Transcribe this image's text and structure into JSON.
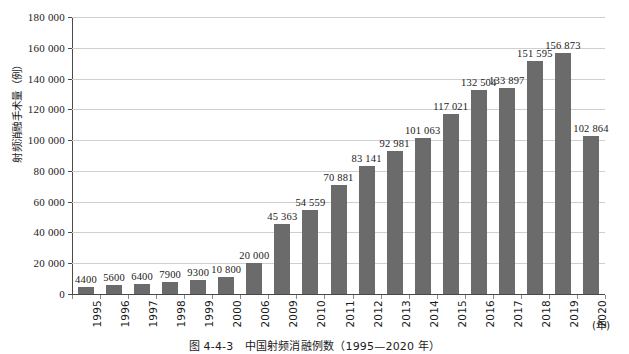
{
  "chart_data": {
    "type": "bar",
    "title": "",
    "xlabel": "(年)",
    "ylabel": "射频消融手术量（例）",
    "categories": [
      "1995",
      "1996",
      "1997",
      "1998",
      "1999",
      "2000",
      "2006",
      "2009",
      "2010",
      "2011",
      "2012",
      "2013",
      "2014",
      "2015",
      "2016",
      "2017",
      "2018",
      "2019",
      "2020"
    ],
    "values": [
      4400,
      5600,
      6400,
      7900,
      9300,
      10800,
      20000,
      45363,
      54559,
      70881,
      83141,
      92981,
      101063,
      117021,
      132504,
      133897,
      151595,
      156873,
      102864
    ],
    "value_labels": [
      "4400",
      "5600",
      "6400",
      "7900",
      "9300",
      "10 800",
      "20 000",
      "45 363",
      "54 559",
      "70 881",
      "83 141",
      "92 981",
      "101 063",
      "117 021",
      "132 504",
      "133 897",
      "151 595",
      "156 873",
      "102 864"
    ],
    "ylim": [
      0,
      180000
    ],
    "ytick_labels": [
      "0",
      "20 000",
      "40 000",
      "60 000",
      "80 000",
      "100 000",
      "120 000",
      "140 000",
      "160 000",
      "180 000"
    ],
    "ytick_values": [
      0,
      20000,
      40000,
      60000,
      80000,
      100000,
      120000,
      140000,
      160000,
      180000
    ],
    "grid": true,
    "legend": "none",
    "bar_color": "#6b6b6b",
    "gridline_color": "#cfcfcf",
    "axis_color": "#4a4a4a"
  },
  "caption": {
    "text": "图 4-4-3　中国射频消融例数（1995—2020 年）"
  }
}
